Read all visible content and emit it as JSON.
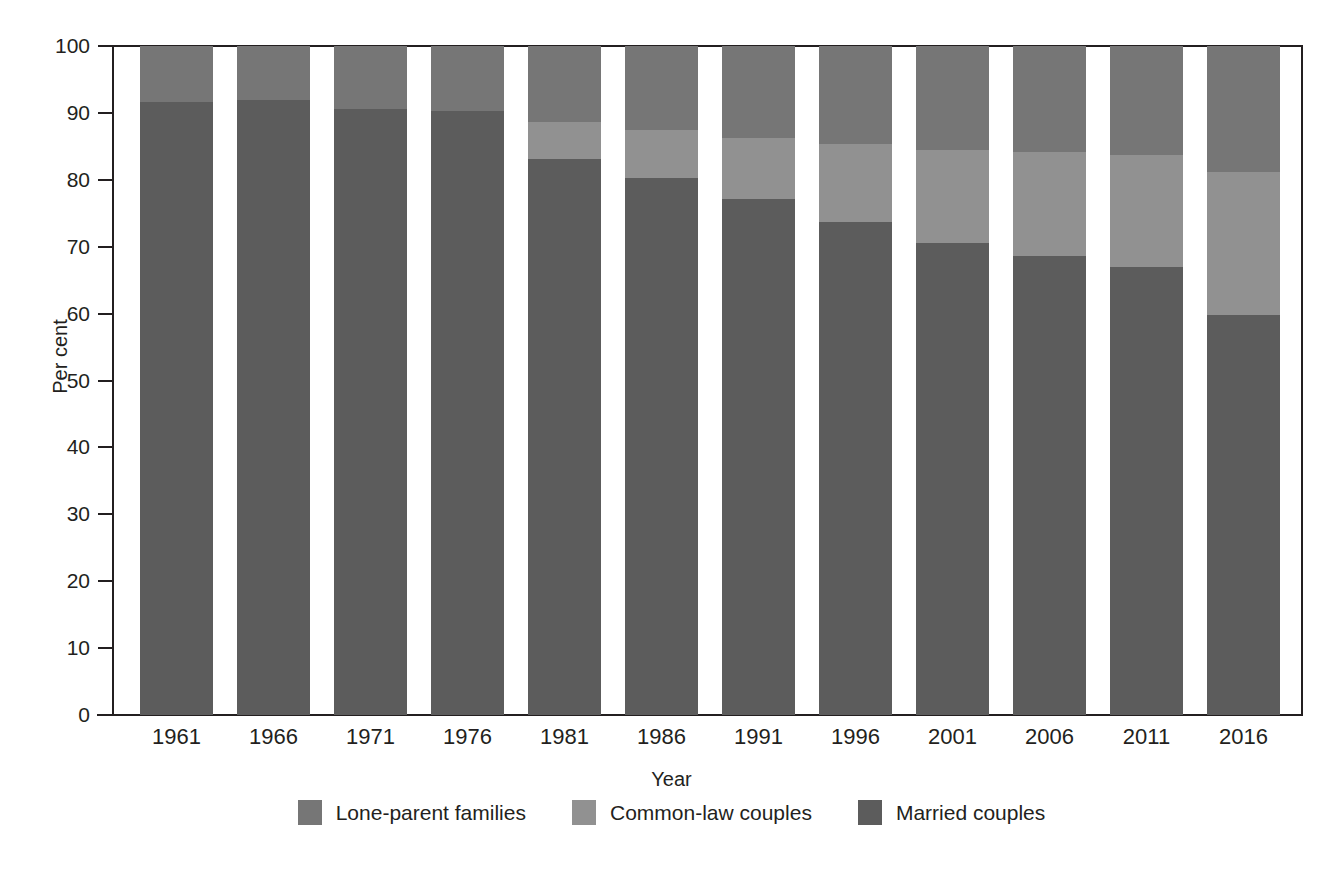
{
  "chart_data": {
    "type": "bar",
    "subtype": "stacked-bar-100",
    "title": "",
    "xlabel": "Year",
    "ylabel": "Per cent",
    "ylim": [
      0,
      100
    ],
    "yticks": [
      0,
      10,
      20,
      30,
      40,
      50,
      60,
      70,
      80,
      90,
      100
    ],
    "ytick_labels": [
      "0",
      "10",
      "20",
      "30",
      "40",
      "50",
      "60",
      "70",
      "80",
      "90",
      "100"
    ],
    "grid": false,
    "legend_position": "bottom",
    "categories": [
      "1961",
      "1966",
      "1971",
      "1976",
      "1981",
      "1986",
      "1991",
      "1996",
      "2001",
      "2006",
      "2011",
      "2016"
    ],
    "series": [
      {
        "name": "Married couples",
        "color": "#5c5c5c",
        "values": [
          91.6,
          91.9,
          90.6,
          90.3,
          83.1,
          80.2,
          77.2,
          73.7,
          70.5,
          68.6,
          67.0,
          59.8
        ]
      },
      {
        "name": "Common-law couples",
        "color": "#919191",
        "values": [
          0.0,
          0.0,
          0.0,
          0.0,
          5.6,
          7.2,
          9.0,
          11.7,
          13.9,
          15.5,
          16.7,
          21.3
        ]
      },
      {
        "name": "Lone-parent families",
        "color": "#767676",
        "values": [
          8.4,
          8.1,
          9.4,
          9.7,
          11.3,
          12.6,
          13.8,
          14.6,
          15.6,
          15.9,
          16.3,
          18.9
        ]
      }
    ]
  },
  "axes": {
    "y_title": "Per cent",
    "x_title": "Year"
  },
  "legend": {
    "items": [
      {
        "label": "Lone-parent families",
        "color": "#767676"
      },
      {
        "label": "Common-law couples",
        "color": "#919191"
      },
      {
        "label": "Married couples",
        "color": "#5c5c5c"
      }
    ]
  },
  "colors": {
    "axis": "#231f20",
    "background": "#ffffff",
    "married": "#5c5c5c",
    "common_law": "#919191",
    "lone_parent": "#767676"
  }
}
